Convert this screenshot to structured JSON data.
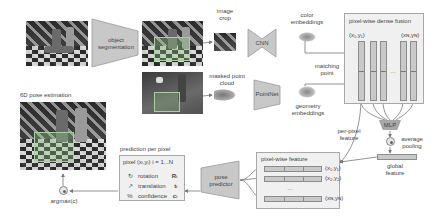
{
  "figure": {
    "type": "architecture-diagram",
    "colors": {
      "module_fill": "#c8c8c8",
      "feature_fill": "#c9c9c9",
      "panel_fill": "#f0f0f0",
      "overlay_green": "#8cc882",
      "arrow": "#777777"
    }
  },
  "stages": {
    "segmentation": {
      "label": "object segmentation"
    },
    "image_crop": {
      "label": "image crop"
    },
    "masked_point_cloud": {
      "label": "masked point cloud"
    },
    "cnn": {
      "label": "CNN"
    },
    "pointnet": {
      "label": "PointNet"
    },
    "color_embeddings": {
      "label": "color embeddings"
    },
    "geometry_embeddings": {
      "label": "geometry embeddings"
    },
    "matching_point": {
      "label": "matching point"
    }
  },
  "dense_fusion": {
    "title": "pixel-wise dense fusion",
    "first_col": "(x₁,y₁)",
    "last_col": "(xɴ,yɴ)",
    "ellipsis": "…"
  },
  "mlp": {
    "label": "MLP"
  },
  "pooling": {
    "label": "average pooling"
  },
  "global_feature": {
    "label": "global feature"
  },
  "per_pixel_feature": {
    "label": "per-pixel feature"
  },
  "pixel_wise_feature": {
    "title": "pixel-wise feature",
    "rows": [
      "(x₁,y₁)",
      "(x₂,y₂)",
      "…",
      "(xɴ,yɴ)"
    ]
  },
  "pose_predictor": {
    "label": "pose predictor"
  },
  "prediction": {
    "title": "prediction per pixel",
    "header": "pixel (xᵢ,yᵢ)  i = 1...N",
    "rows": [
      {
        "icon": "rotation-icon",
        "glyph": "↻",
        "label": "rotation",
        "symbol": "Rᵢ"
      },
      {
        "icon": "translation-icon",
        "glyph": "↗",
        "label": "translation",
        "symbol": "tᵢ"
      },
      {
        "icon": "confidence-icon",
        "glyph": "%",
        "label": "confidence",
        "symbol": "cᵢ"
      }
    ]
  },
  "argmax": {
    "label": "argmax(c)"
  },
  "output": {
    "title": "6D pose estimation"
  }
}
